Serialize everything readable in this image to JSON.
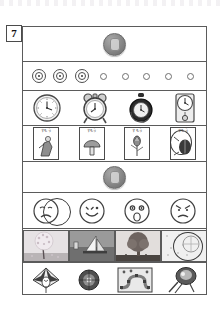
{
  "page": {
    "question_number": "7",
    "background_color": "#ffffff",
    "frame_color": "#5b5b5b"
  },
  "rows": [
    {
      "id": "row-coin-top",
      "name": "row-prompt-icon-top",
      "kind": "single-icon",
      "icon": "gray-disc-icon"
    },
    {
      "id": "row-dots",
      "name": "row-target-dots",
      "kind": "dots",
      "items": [
        {
          "type": "target-dot-filled",
          "name": "target-dot-1",
          "selected": true
        },
        {
          "type": "target-dot-filled",
          "name": "target-dot-2",
          "selected": true
        },
        {
          "type": "target-dot-filled",
          "name": "target-dot-3",
          "selected": true
        },
        {
          "type": "empty-dot",
          "name": "empty-dot-4",
          "selected": false
        },
        {
          "type": "empty-dot",
          "name": "empty-dot-5",
          "selected": false
        },
        {
          "type": "empty-dot",
          "name": "empty-dot-6",
          "selected": false
        },
        {
          "type": "empty-dot",
          "name": "empty-dot-7",
          "selected": false
        },
        {
          "type": "empty-dot",
          "name": "empty-dot-8",
          "selected": false
        }
      ]
    },
    {
      "id": "row-clocks",
      "name": "row-clock-choices",
      "kind": "clocks",
      "items": [
        {
          "name": "wall-clock-icon",
          "label": "wall clock"
        },
        {
          "name": "alarm-clock-icon",
          "label": "alarm clock"
        },
        {
          "name": "pocket-watch-icon",
          "label": "pocket watch"
        },
        {
          "name": "pendulum-clock-icon",
          "label": "pendulum clock"
        }
      ]
    },
    {
      "id": "row-cards",
      "name": "row-card-choices",
      "kind": "cards",
      "circled_index": 3,
      "items": [
        {
          "name": "card-sumo",
          "label": "すもう",
          "art": "wrestler"
        },
        {
          "name": "card-mushroom",
          "label": "すもう",
          "art": "mushroom"
        },
        {
          "name": "card-flower",
          "label": "すもう",
          "art": "flower"
        },
        {
          "name": "card-insect",
          "label": "すもう",
          "art": "insect"
        }
      ]
    },
    {
      "id": "row-coin-bottom",
      "name": "row-prompt-icon-bottom",
      "kind": "single-icon",
      "icon": "gray-disc-icon"
    },
    {
      "id": "row-faces",
      "name": "row-face-choices",
      "kind": "faces",
      "circled_index": 0,
      "items": [
        {
          "name": "sad-face-icon",
          "label": "sad"
        },
        {
          "name": "happy-face-icon",
          "label": "happy"
        },
        {
          "name": "surprised-face-icon",
          "label": "surprised"
        },
        {
          "name": "angry-face-icon",
          "label": "angry"
        }
      ]
    },
    {
      "id": "row-seasons",
      "name": "row-season-photo-choices",
      "kind": "photos",
      "circled_index": 3,
      "items": [
        {
          "name": "photo-spring-blossom-tree",
          "label": "spring blossom tree"
        },
        {
          "name": "photo-summer-sailboat",
          "label": "summer sailboat"
        },
        {
          "name": "photo-autumn-tree",
          "label": "autumn tree"
        },
        {
          "name": "photo-winter-snow",
          "label": "winter snow"
        }
      ]
    },
    {
      "id": "row-newyear",
      "name": "row-new-year-toy-choices",
      "kind": "toys",
      "items": [
        {
          "name": "kite-icon",
          "label": "kite"
        },
        {
          "name": "spinning-top-icon",
          "label": "spinning top"
        },
        {
          "name": "sugoroku-board-icon",
          "label": "sugoroku board"
        },
        {
          "name": "hanetsuki-paddle-icon",
          "label": "hanetsuki paddle"
        }
      ]
    }
  ]
}
